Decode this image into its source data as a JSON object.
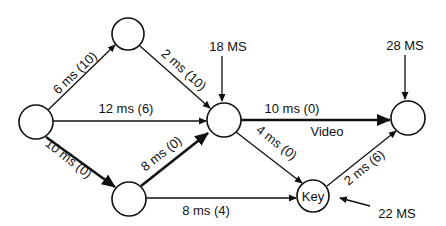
{
  "diagram": {
    "type": "activity-network",
    "nodes": [
      {
        "id": "start",
        "label": "",
        "cx": 36,
        "cy": 122,
        "r": 17
      },
      {
        "id": "top",
        "label": "",
        "cx": 128,
        "cy": 34,
        "r": 16
      },
      {
        "id": "middle",
        "label": "",
        "cx": 224,
        "cy": 120,
        "r": 17
      },
      {
        "id": "bottom",
        "label": "",
        "cx": 129,
        "cy": 199,
        "r": 17
      },
      {
        "id": "key",
        "label": "Key",
        "cx": 313,
        "cy": 196,
        "r": 16
      },
      {
        "id": "end",
        "label": "",
        "cx": 408,
        "cy": 118,
        "r": 17
      }
    ],
    "edges": [
      {
        "from": "start",
        "to": "top",
        "label": "6 ms (10)",
        "critical": false
      },
      {
        "from": "top",
        "to": "middle",
        "label": "2 ms (10)",
        "critical": false
      },
      {
        "from": "start",
        "to": "middle",
        "label": "12 ms (6)",
        "critical": false
      },
      {
        "from": "start",
        "to": "bottom",
        "label": "10 ms (0)",
        "critical": true
      },
      {
        "from": "bottom",
        "to": "middle",
        "label": "8 ms (0)",
        "critical": true
      },
      {
        "from": "bottom",
        "to": "key",
        "label": "8 ms (4)",
        "critical": false
      },
      {
        "from": "middle",
        "to": "key",
        "label": "4 ms (0)",
        "critical": false
      },
      {
        "from": "middle",
        "to": "end",
        "label": "10 ms (0)",
        "sublabel": "Video",
        "critical": true
      },
      {
        "from": "key",
        "to": "end",
        "label": "2 ms (6)",
        "critical": false
      }
    ],
    "external_inputs": [
      {
        "to": "middle",
        "label": "18 MS"
      },
      {
        "to": "end",
        "label": "28 MS"
      },
      {
        "to": "key",
        "label": "22 MS"
      }
    ]
  },
  "labels": {
    "e_start_top": "6 ms (10)",
    "e_top_middle": "2 ms (10)",
    "e_start_middle": "12 ms (6)",
    "e_start_bottom": "10 ms (0)",
    "e_bottom_middle": "8 ms (0)",
    "e_bottom_key": "8 ms (4)",
    "e_middle_key": "4 ms (0)",
    "e_middle_end": "10 ms (0)",
    "e_middle_end_sub": "Video",
    "e_key_end": "2 ms (6)",
    "node_key": "Key",
    "ext_middle": "18 MS",
    "ext_end": "28 MS",
    "ext_key": "22 MS"
  }
}
